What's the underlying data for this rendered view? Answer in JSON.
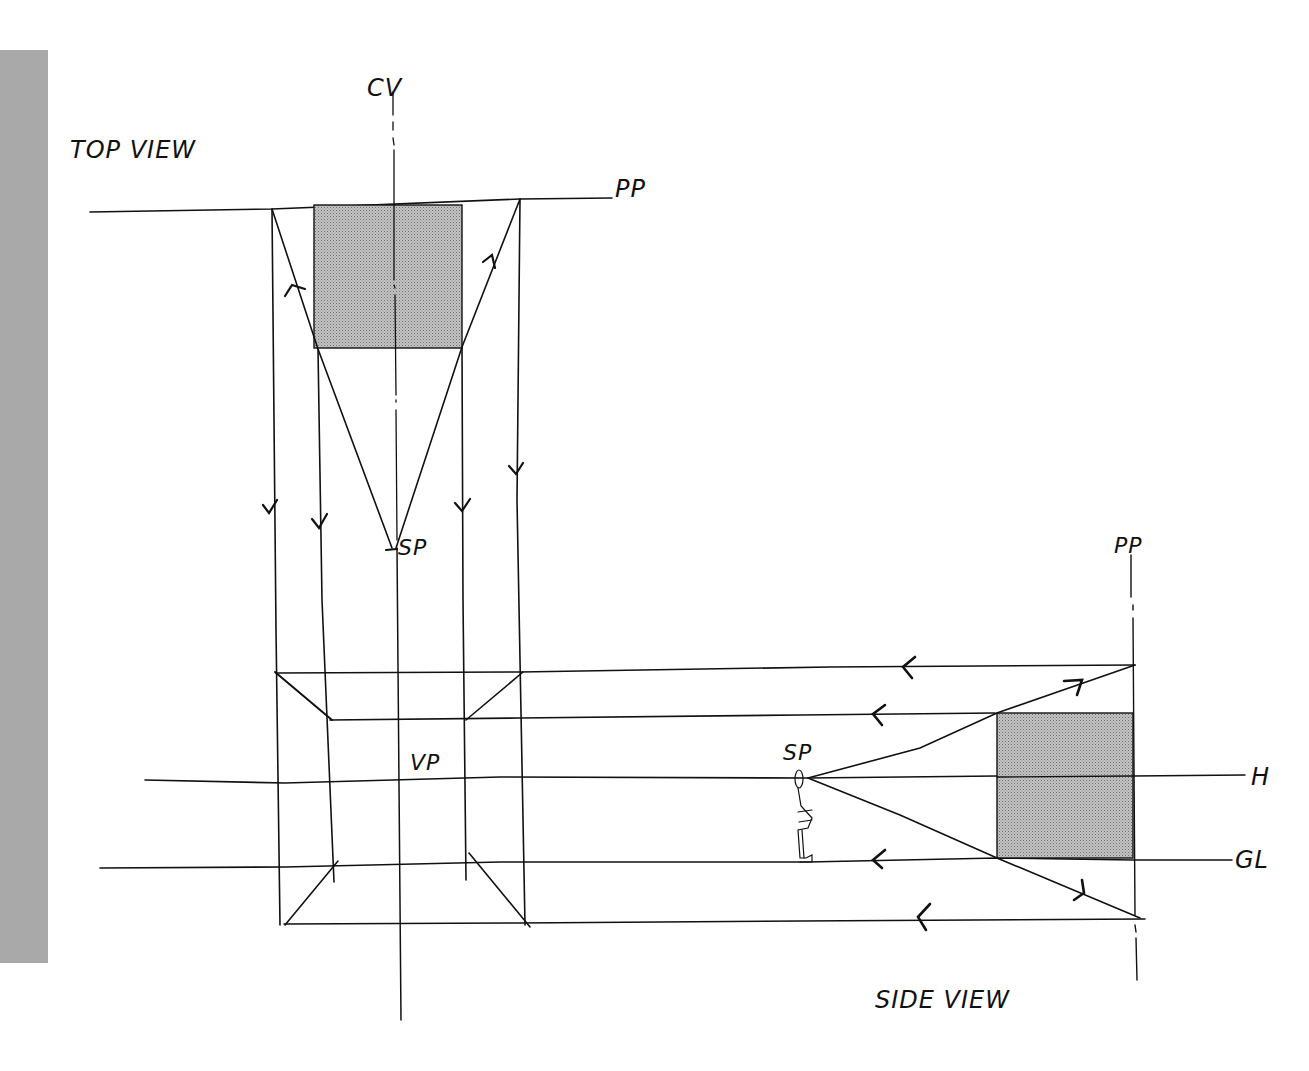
{
  "labels": {
    "top_view": "TOP VIEW",
    "side_view": "SIDE VIEW",
    "cv": "CV",
    "pp_top": "PP",
    "pp_side": "PP",
    "sp_top": "SP",
    "sp_side": "SP",
    "vp": "VP",
    "horizon": "H",
    "ground_line": "GL"
  },
  "colors": {
    "ink": "#111111",
    "hatch_fill": "#b8b8b8",
    "side_bar": "#a9a9a9",
    "background": "#ffffff"
  },
  "diagram": {
    "top_view_square": {
      "x": 314,
      "y": 205,
      "w": 148,
      "h": 143
    },
    "side_view_square": {
      "x": 997,
      "y": 713,
      "w": 136,
      "h": 145
    },
    "station_point_top": {
      "x": 393,
      "y": 548
    },
    "station_point_side": {
      "x": 808,
      "y": 778
    }
  }
}
